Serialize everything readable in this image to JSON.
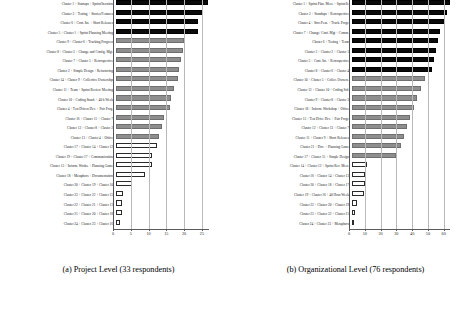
{
  "figure": {
    "type": "two-panel-horizontal-bar-chart"
  },
  "captions": {
    "left": "(a) Project Level (33 respondents)",
    "right": "(b) Organizational Level (76 respondents)"
  },
  "chart_data": [
    {
      "type": "bar",
      "orientation": "horizontal",
      "panel": "a",
      "title": "(a) Project Level (33 respondents)",
      "xlabel": "",
      "ylabel": "",
      "xlim": [
        0,
        27
      ],
      "xticks": [
        0,
        5,
        10,
        15,
        20,
        25
      ],
      "xticklabels": [
        "0",
        "5",
        "10",
        "15",
        "20",
        "25"
      ],
      "grid": true,
      "legend": "none",
      "categories": [
        "Cluster 1 + Startups + Sprint/Iteration",
        "Cluster 3 + Testing + Stories/Features",
        "Cluster 6 + Cont. Int. + Short Releases",
        "Cluster 5 + Cluster 1 + Sprint Planning Meeting",
        "Cluster 9 + Cluster 6 + Tracking Progress",
        "Cluster 8 + Cluster 3 + Change and Config. Mgt.",
        "Cluster 7 + Cluster 5 + Retrospective",
        "Cluster 2 + Simple Design + Refactoring",
        "Cluster 14 + Cluster 9 + Collective Ownership",
        "Cluster 11 + Team + Sprint Review Meeting",
        "Cluster 10 + Coding Stand. + 40 h Week",
        "Cluster 4 + Test Driven Dev. + Pair Prog.",
        "Cluster 16 + Cluster 11 + Cluster 7",
        "Cluster 12 + Cluster 8 + Cluster 2",
        "Cluster 13 + Cluster 4 + Office",
        "Cluster 17 + Cluster 14 + Cluster 12",
        "Cluster 19 + Cluster 17 + Communication",
        "Cluster 15 + Inform. Works. + Planning Game",
        "Cluster 18 + Metaphors + Documentation",
        "Cluster 20 + Cluster 19 + Cluster 10",
        "Cluster 23 + Cluster 22 + Cluster 15",
        "Cluster 22 + Cluster 21 + Cluster 13",
        "Cluster 21 + Cluster 20 + Cluster 18",
        "Cluster 24 + Cluster 23 + Cluster 16"
      ],
      "values": [
        26.0,
        24.2,
        23.2,
        23.0,
        19.0,
        18.9,
        18.2,
        17.6,
        17.3,
        16.4,
        15.6,
        15.1,
        13.5,
        12.8,
        12.1,
        11.6,
        10.2,
        10.1,
        8.2,
        4.4,
        2.1,
        1.8,
        1.6,
        1.0
      ],
      "styles": [
        "solid-dark",
        "solid-dark",
        "solid-dark",
        "solid-dark",
        "solid-gray",
        "solid-gray",
        "solid-gray",
        "solid-gray",
        "solid-gray",
        "solid-gray",
        "solid-gray",
        "solid-gray",
        "solid-gray",
        "solid-gray",
        "solid-gray",
        "hollow",
        "hollow",
        "hollow",
        "hollow",
        "hollow",
        "hollow",
        "hollow",
        "hollow",
        "hollow"
      ]
    },
    {
      "type": "bar",
      "orientation": "horizontal",
      "panel": "b",
      "title": "(b) Organizational Level (76 respondents)",
      "xlabel": "",
      "ylabel": "",
      "xlim": [
        0,
        64
      ],
      "xticks": [
        0,
        10,
        20,
        30,
        40,
        50,
        60
      ],
      "xticklabels": [
        "0",
        "10",
        "20",
        "30",
        "40",
        "50",
        "60"
      ],
      "grid": true,
      "legend": "none",
      "categories": [
        "Cluster 1 + Sprint Plan. Meet. + Sprint/It.",
        "Cluster 2 + Standups + Retrospective",
        "Cluster 4 + Stor./Feat. + Track. Progr.",
        "Cluster 7 + Change/ Conf. Mgt + Comm.",
        "Cluster 6 + Testing + Team",
        "Cluster 3 + Cluster 2 + Cluster 1",
        "Cluster 5 + Cont. Int. + Retrospective",
        "Cluster 8 + Cluster 6 + Cluster 4",
        "Cluster 10 + Cluster 5 + Collec. Owners.",
        "Cluster 13 + Cluster 10 + Coding Std.",
        "Cluster 9 + Cluster 8 + Cluster 3",
        "Cluster 18 + Inform. Workshop + Office",
        "Cluster 15 + Test Drive Dev. + Pair Progr.",
        "Cluster 12 + Cluster 13 + Cluster 7",
        "Cluster 11 + Cluster 9 + Short Releases",
        "Cluster 21 + Doc. + Planning Game",
        "Cluster 17 + Cluster 15 + Simple Design",
        "Cluster 14 + Cluster 12 + Sprint Rev. Meet.",
        "Cluster 16 + Cluster 14 + Cluster 13",
        "Cluster 20 + Cluster 18 + Cluster 17",
        "Cluster 19 + Cluster 16 + 40 Hour Week",
        "Cluster 22 + Cluster 20 + Cluster 19",
        "Cluster 23 + Cluster 22 + Cluster 21",
        "Cluster 24 + Cluster 23 + Metaphors"
      ],
      "values": [
        62.0,
        60.5,
        58.0,
        56.0,
        54.5,
        53.5,
        52.0,
        51.0,
        46.0,
        43.5,
        41.5,
        39.5,
        37.0,
        35.0,
        33.0,
        31.0,
        28.0,
        9.5,
        8.5,
        8.0,
        7.5,
        3.0,
        2.2,
        1.4
      ],
      "styles": [
        "solid-dark",
        "solid-dark",
        "solid-dark",
        "solid-dark",
        "solid-dark",
        "solid-dark",
        "solid-dark",
        "solid-dark",
        "solid-gray",
        "solid-gray",
        "solid-gray",
        "solid-gray",
        "solid-gray",
        "solid-gray",
        "solid-gray",
        "solid-gray",
        "solid-gray",
        "hollow",
        "hollow",
        "hollow",
        "hollow",
        "hollow",
        "hollow",
        "hollow"
      ]
    }
  ]
}
